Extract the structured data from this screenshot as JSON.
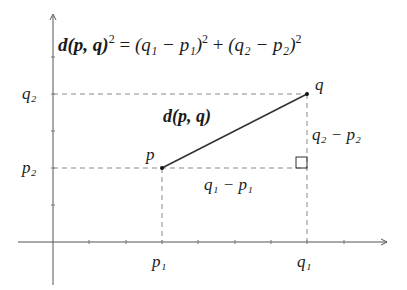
{
  "diagram": {
    "formula": {
      "lhs": "d(p, q)",
      "lhs_exp": "2",
      "eq": "=",
      "term1": "(q₁ − p₁)",
      "term1_exp": "2",
      "plus": "+",
      "term2": "(q₂ − p₂)",
      "term2_exp": "2"
    },
    "points": {
      "p": {
        "label": "p",
        "x_label": "p₁",
        "y_label": "p₂"
      },
      "q": {
        "label": "q",
        "x_label": "q₁",
        "y_label": "q₂"
      }
    },
    "segment_label": "d(p, q)",
    "horizontal_leg_label": "q₁ − p₁",
    "vertical_leg_label": "q₂ − p₂",
    "right_angle_marker": "square",
    "colors": {
      "ink": "#1a1a1a",
      "dashed": "#777777",
      "axis": "#555555",
      "background": "#ffffff"
    }
  }
}
